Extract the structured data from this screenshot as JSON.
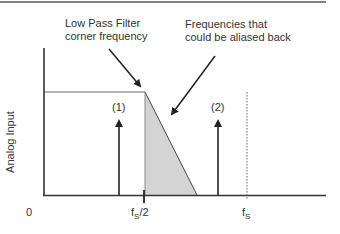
{
  "diagram": {
    "annotations": {
      "filter_corner_line1": "Low Pass Filter",
      "filter_corner_line2": "corner frequency",
      "aliased_line1": "Frequencies that",
      "aliased_line2": "could be aliased back"
    },
    "y_axis_label": "Analog Input",
    "x_labels": {
      "origin": "0",
      "half_fs_main": "f",
      "half_fs_sub": "S",
      "half_fs_rest": "/2",
      "fs_main": "f",
      "fs_sub": "S"
    },
    "signals": [
      {
        "label": "(1)"
      },
      {
        "label": "(2)"
      }
    ],
    "colors": {
      "line": "#333333",
      "passband": "#9a9a9a",
      "shade": "#d4d4d4",
      "border": "#555555"
    }
  }
}
